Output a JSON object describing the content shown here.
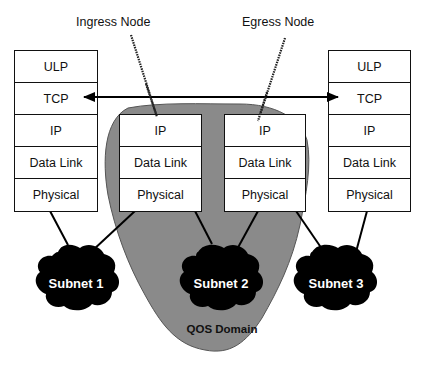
{
  "diagram": {
    "node_labels": {
      "ingress": "Ingress Node",
      "egress": "Egress Node"
    },
    "left_host": {
      "layers": [
        "ULP",
        "TCP",
        "IP",
        "Data Link",
        "Physical"
      ]
    },
    "right_host": {
      "layers": [
        "ULP",
        "TCP",
        "IP",
        "Data Link",
        "Physical"
      ]
    },
    "ingress_node": {
      "layers": [
        "IP",
        "Data Link",
        "Physical"
      ]
    },
    "egress_node": {
      "layers": [
        "IP",
        "Data Link",
        "Physical"
      ]
    },
    "subnets": [
      {
        "label": "Subnet 1"
      },
      {
        "label": "Subnet 2"
      },
      {
        "label": "Subnet 3"
      }
    ],
    "domain": {
      "label": "QOS Domain",
      "color": "#8a8a8a"
    },
    "connection": {
      "type": "bidirectional-arrow",
      "from": "left_host.TCP",
      "to": "right_host.TCP"
    },
    "colors": {
      "subnet_fill": "#000000",
      "box_border": "#111111",
      "domain_fill": "#8a8a8a"
    }
  }
}
